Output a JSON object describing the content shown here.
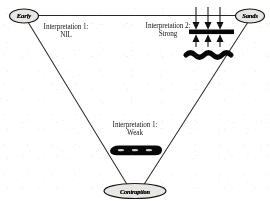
{
  "diagram": {
    "nodes": [
      {
        "id": "top-left",
        "label": "Early",
        "shape": "ellipse",
        "cx": 24,
        "cy": 16
      },
      {
        "id": "top-right",
        "label": "Sands",
        "shape": "ellipse",
        "cx": 250,
        "cy": 16
      },
      {
        "id": "bottom",
        "label": "Contraption",
        "shape": "ellipse",
        "cx": 135,
        "cy": 191
      }
    ],
    "labels": {
      "left": {
        "line1": "Interpretation 1:",
        "line2": "NIL"
      },
      "right": {
        "line1": "Interpretation 2:",
        "line2": "Strong"
      },
      "center": {
        "line1": "Interpretation 1:",
        "line2": "Weak"
      }
    },
    "schematic_right": {
      "name": "strong-interpretation-schematic",
      "down_arrows": 3,
      "up_arrows": 3,
      "bar": "solid-black-horizontal-bar",
      "wave": "thick-black-wavy-line"
    },
    "schematic_center": {
      "name": "weak-interpretation-blob",
      "shape": "dark-elongated-blob"
    },
    "colors": {
      "ink": "#1a1a1a",
      "line": "#3a3a3a",
      "fill": "#0d0d0d",
      "paper": "#fdfdfc"
    }
  }
}
